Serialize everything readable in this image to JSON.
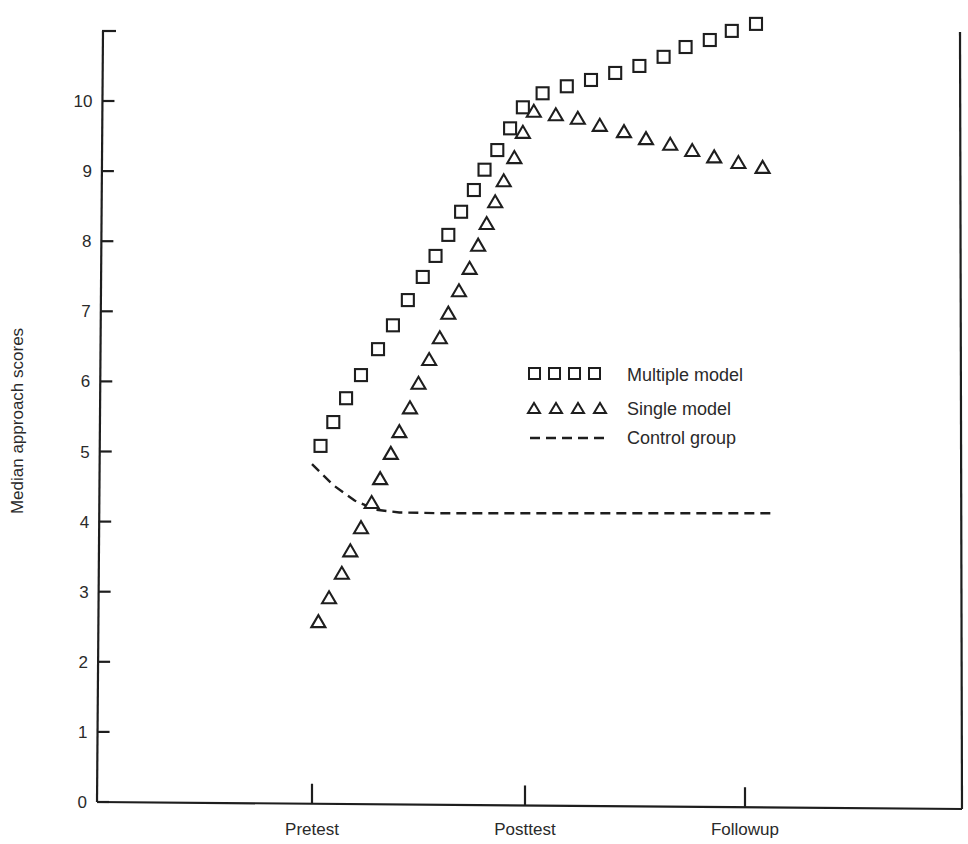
{
  "chart_data": {
    "type": "scatter",
    "title": "",
    "xlabel": "",
    "ylabel": "Median approach scores",
    "ylim": [
      0,
      11
    ],
    "y_ticks": [
      0,
      1,
      2,
      3,
      4,
      5,
      6,
      7,
      8,
      9,
      10
    ],
    "x_ticks": [
      "Pretest",
      "Posttest",
      "Followup"
    ],
    "grid": false,
    "legend_position": "center-right (inside plot)",
    "legend": [
      {
        "label": "Multiple model",
        "marker": "square"
      },
      {
        "label": "Single model",
        "marker": "triangle"
      },
      {
        "label": "Control group",
        "marker": "dashed-line"
      }
    ],
    "x_scale_note": "x expressed in phase units: 0 = Pretest, 1 = Posttest, 2 = Followup",
    "series": [
      {
        "name": "Multiple model",
        "marker": "square",
        "points": [
          [
            0.04,
            5.08
          ],
          [
            0.1,
            5.42
          ],
          [
            0.16,
            5.76
          ],
          [
            0.23,
            6.09
          ],
          [
            0.31,
            6.46
          ],
          [
            0.38,
            6.8
          ],
          [
            0.45,
            7.16
          ],
          [
            0.52,
            7.49
          ],
          [
            0.58,
            7.79
          ],
          [
            0.64,
            8.09
          ],
          [
            0.7,
            8.42
          ],
          [
            0.76,
            8.73
          ],
          [
            0.81,
            9.02
          ],
          [
            0.87,
            9.3
          ],
          [
            0.93,
            9.61
          ],
          [
            0.99,
            9.91
          ],
          [
            1.08,
            10.11
          ],
          [
            1.19,
            10.21
          ],
          [
            1.3,
            10.3
          ],
          [
            1.41,
            10.4
          ],
          [
            1.52,
            10.5
          ],
          [
            1.63,
            10.63
          ],
          [
            1.73,
            10.77
          ],
          [
            1.84,
            10.87
          ],
          [
            1.94,
            11.0
          ],
          [
            2.05,
            11.1
          ]
        ]
      },
      {
        "name": "Single model",
        "marker": "triangle",
        "points": [
          [
            0.03,
            2.58
          ],
          [
            0.08,
            2.92
          ],
          [
            0.14,
            3.27
          ],
          [
            0.18,
            3.59
          ],
          [
            0.23,
            3.92
          ],
          [
            0.28,
            4.28
          ],
          [
            0.32,
            4.62
          ],
          [
            0.37,
            4.98
          ],
          [
            0.41,
            5.29
          ],
          [
            0.46,
            5.63
          ],
          [
            0.5,
            5.98
          ],
          [
            0.55,
            6.32
          ],
          [
            0.6,
            6.63
          ],
          [
            0.64,
            6.98
          ],
          [
            0.69,
            7.3
          ],
          [
            0.74,
            7.62
          ],
          [
            0.78,
            7.95
          ],
          [
            0.82,
            8.26
          ],
          [
            0.86,
            8.57
          ],
          [
            0.9,
            8.87
          ],
          [
            0.95,
            9.2
          ],
          [
            0.99,
            9.56
          ],
          [
            1.04,
            9.86
          ],
          [
            1.14,
            9.81
          ],
          [
            1.24,
            9.76
          ],
          [
            1.34,
            9.66
          ],
          [
            1.45,
            9.57
          ],
          [
            1.55,
            9.47
          ],
          [
            1.66,
            9.39
          ],
          [
            1.76,
            9.3
          ],
          [
            1.86,
            9.21
          ],
          [
            1.97,
            9.13
          ],
          [
            2.08,
            9.06
          ]
        ]
      },
      {
        "name": "Control group",
        "marker": "dashed-line",
        "points": [
          [
            0.0,
            4.82
          ],
          [
            0.1,
            4.52
          ],
          [
            0.2,
            4.3
          ],
          [
            0.3,
            4.17
          ],
          [
            0.41,
            4.13
          ],
          [
            0.6,
            4.12
          ],
          [
            1.0,
            4.12
          ],
          [
            1.5,
            4.12
          ],
          [
            2.0,
            4.12
          ],
          [
            2.13,
            4.12
          ]
        ]
      }
    ]
  },
  "axes": {
    "ylabel": "Median approach scores",
    "y_tick_labels": [
      "0",
      "1",
      "2",
      "3",
      "4",
      "5",
      "6",
      "7",
      "8",
      "9",
      "10"
    ],
    "x_tick_labels": [
      "Pretest",
      "Posttest",
      "Followup"
    ]
  },
  "legend": {
    "multiple_label": "Multiple model",
    "single_label": "Single model",
    "control_label": "Control group"
  },
  "style": {
    "ink": "#1e1e1e",
    "text": "#2a2a2a",
    "background": "#ffffff"
  }
}
